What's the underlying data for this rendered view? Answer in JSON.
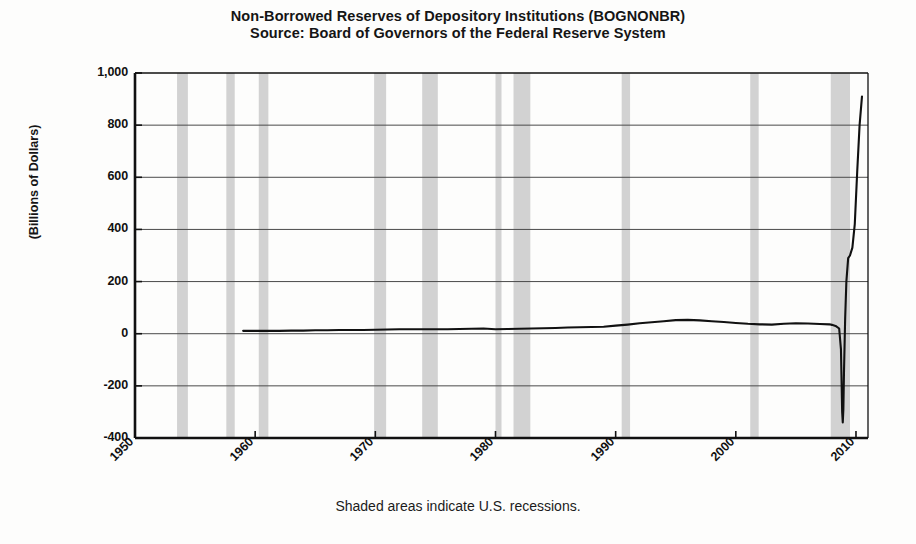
{
  "title": {
    "line1": "Non-Borrowed Reserves of Depository Institutions (BOGNONBR)",
    "line2": "Source: Board of Governors of the Federal Reserve System"
  },
  "footnote": "Shaded areas indicate U.S. recessions.",
  "colors": {
    "line": "#111111",
    "recession_band": "#d2d2d2",
    "grid": "#4a4a4a",
    "axis": "#111111",
    "background": "#fdfdfc",
    "text": "#151515"
  },
  "chart_data": {
    "type": "line",
    "title": "Non-Borrowed Reserves of Depository Institutions (BOGNONBR)",
    "subtitle": "Source: Board of Governors of the Federal Reserve System",
    "xlabel": "",
    "ylabel": "(Billions of Dollars)",
    "xlim": [
      1950,
      2011
    ],
    "ylim": [
      -400,
      1000
    ],
    "ytick_labels": [
      "1,000",
      "800",
      "600",
      "400",
      "200",
      "0",
      "-200",
      "-400"
    ],
    "ytick_values": [
      1000,
      800,
      600,
      400,
      200,
      0,
      -200,
      -400
    ],
    "xtick_labels": [
      "1950",
      "1960",
      "1970",
      "1980",
      "1990",
      "2000",
      "2010"
    ],
    "xtick_values": [
      1950,
      1960,
      1970,
      1980,
      1990,
      2000,
      2010
    ],
    "grid": true,
    "legend": false,
    "annotation": "Shaded areas indicate U.S. recessions.",
    "series": [
      {
        "name": "Non-Borrowed Reserves",
        "units": "Billions of Dollars",
        "x": [
          1959.0,
          1960.0,
          1961.0,
          1962.0,
          1963.0,
          1964.0,
          1965.0,
          1966.0,
          1967.0,
          1968.0,
          1969.0,
          1970.0,
          1971.0,
          1972.0,
          1973.0,
          1974.0,
          1975.0,
          1976.0,
          1977.0,
          1978.0,
          1979.0,
          1980.0,
          1981.0,
          1982.0,
          1983.0,
          1984.0,
          1985.0,
          1986.0,
          1987.0,
          1988.0,
          1989.0,
          1990.0,
          1991.0,
          1992.0,
          1993.0,
          1994.0,
          1995.0,
          1996.0,
          1997.0,
          1998.0,
          1999.0,
          2000.0,
          2001.0,
          2002.0,
          2003.0,
          2004.0,
          2005.0,
          2006.0,
          2007.0,
          2007.8,
          2008.0,
          2008.3,
          2008.6,
          2008.75,
          2008.8,
          2008.85,
          2008.9,
          2008.95,
          2009.0,
          2009.1,
          2009.2,
          2009.35,
          2009.5,
          2009.7,
          2009.9,
          2010.1,
          2010.3,
          2010.5
        ],
        "y": [
          11,
          11,
          11,
          11,
          12,
          12,
          13,
          13,
          14,
          14,
          14,
          15,
          16,
          17,
          17,
          17,
          17,
          17,
          18,
          19,
          20,
          17,
          18,
          19,
          20,
          21,
          22,
          24,
          25,
          26,
          27,
          31,
          35,
          40,
          44,
          48,
          52,
          53,
          51,
          48,
          45,
          41,
          38,
          36,
          35,
          38,
          40,
          39,
          37,
          36,
          34,
          30,
          20,
          -60,
          -180,
          -300,
          -340,
          -290,
          -150,
          60,
          200,
          290,
          300,
          330,
          420,
          620,
          800,
          910
        ]
      }
    ],
    "recessions": [
      {
        "label": "1953-1954",
        "start": 1953.5,
        "end": 1954.4
      },
      {
        "label": "1957-1958",
        "start": 1957.6,
        "end": 1958.3
      },
      {
        "label": "1960-1961",
        "start": 1960.3,
        "end": 1961.1
      },
      {
        "label": "1969-1970",
        "start": 1969.9,
        "end": 1970.9
      },
      {
        "label": "1973-1975",
        "start": 1973.9,
        "end": 1975.2
      },
      {
        "label": "1980",
        "start": 1980.0,
        "end": 1980.5
      },
      {
        "label": "1981-1982",
        "start": 1981.5,
        "end": 1982.9
      },
      {
        "label": "1990-1991",
        "start": 1990.5,
        "end": 1991.2
      },
      {
        "label": "2001",
        "start": 2001.2,
        "end": 2001.9
      },
      {
        "label": "2007-2009",
        "start": 2007.9,
        "end": 2009.5
      }
    ]
  }
}
